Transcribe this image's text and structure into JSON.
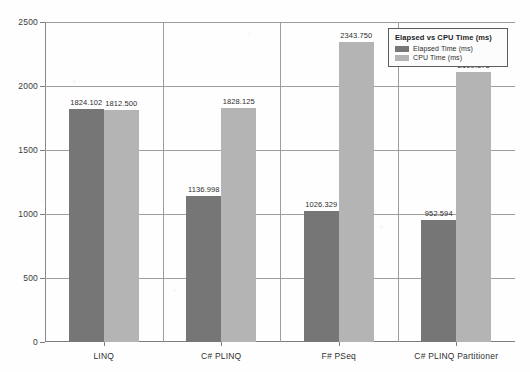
{
  "chart_data": {
    "type": "bar",
    "title": "Elapsed vs CPU Time (ms)",
    "xlabel": "",
    "ylabel": "",
    "ylim": [
      0,
      2500
    ],
    "yticks": [
      0,
      500,
      1000,
      1500,
      2000,
      2500
    ],
    "ytick_labels": [
      "0",
      "500",
      "1000",
      "1500",
      "2000",
      "2500"
    ],
    "grid": true,
    "legend_position": "top-right",
    "categories": [
      "LINQ",
      "C# PLINQ",
      "F# PSeq",
      "C# PLINQ Partitioner"
    ],
    "series": [
      {
        "name": "Elapsed Time (ms)",
        "color": "#767676",
        "values": [
          1824.102,
          1136.998,
          1026.329,
          952.594
        ],
        "labels": [
          "1824.102",
          "1136.998",
          "1026.329",
          "952.594"
        ]
      },
      {
        "name": "CPU Time (ms)",
        "color": "#b4b4b4",
        "values": [
          1812.5,
          1828.125,
          2343.75,
          2109.375
        ],
        "labels": [
          "1812.500",
          "1828.125",
          "2343.750",
          "2109.375"
        ]
      }
    ]
  },
  "legend": {
    "title": "Elapsed vs CPU Time (ms)",
    "entries": [
      {
        "label": "Elapsed Time (ms)",
        "swatch": "elapsed"
      },
      {
        "label": "CPU Time (ms)",
        "swatch": "cpu"
      }
    ]
  }
}
